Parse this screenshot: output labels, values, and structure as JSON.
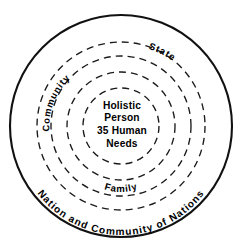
{
  "diagram": {
    "type": "concentric-circles",
    "background_color": "#ffffff",
    "stroke_color": "#111111",
    "center": {
      "x": 121,
      "y": 126
    },
    "center_label": {
      "lines": [
        "Holistic",
        "Person",
        "35 Human",
        "Needs"
      ]
    },
    "rings": [
      {
        "id": "ring-inner-core",
        "label": "",
        "radius": 38,
        "style": "dashed"
      },
      {
        "id": "ring-family",
        "label": "Family",
        "radius": 54,
        "style": "dashed"
      },
      {
        "id": "ring-community",
        "label": "Community",
        "radius": 70,
        "style": "dashed"
      },
      {
        "id": "ring-state",
        "label": "State",
        "radius": 84,
        "style": "dashed"
      },
      {
        "id": "ring-nation",
        "label": "Nation and Community of Nations",
        "radius": 111,
        "style": "solid"
      }
    ]
  }
}
